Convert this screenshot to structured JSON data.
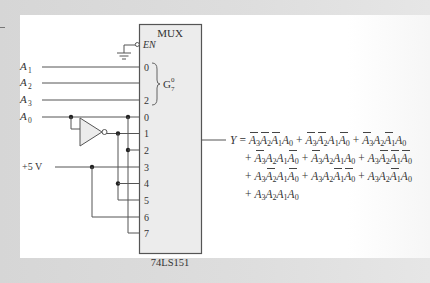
{
  "mux": {
    "title": "MUX",
    "enable_label": "EN",
    "part_number": "74LS151",
    "select_group": {
      "label": "G",
      "superscript": "0",
      "subscript": "7",
      "pins": [
        "0",
        "",
        "2"
      ]
    },
    "data_pins": [
      "0",
      "1",
      "2",
      "3",
      "4",
      "5",
      "6",
      "7"
    ]
  },
  "inputs": {
    "A1": {
      "name": "A",
      "sub": "1"
    },
    "A2": {
      "name": "A",
      "sub": "2"
    },
    "A3": {
      "name": "A",
      "sub": "3"
    },
    "A0": {
      "name": "A",
      "sub": "0"
    },
    "vcc": "+5 V"
  },
  "output": {
    "label": "Y",
    "equals": "=",
    "plus": "+",
    "terms": [
      [
        {
          "v": "A",
          "s": "3",
          "bar": true
        },
        {
          "v": "A",
          "s": "2",
          "bar": true
        },
        {
          "v": "A",
          "s": "1",
          "bar": true
        },
        {
          "v": "A",
          "s": "0",
          "bar": false
        }
      ],
      [
        {
          "v": "A",
          "s": "3",
          "bar": true
        },
        {
          "v": "A",
          "s": "2",
          "bar": true
        },
        {
          "v": "A",
          "s": "1",
          "bar": false
        },
        {
          "v": "A",
          "s": "0",
          "bar": true
        }
      ],
      [
        {
          "v": "A",
          "s": "3",
          "bar": true
        },
        {
          "v": "A",
          "s": "2",
          "bar": false
        },
        {
          "v": "A",
          "s": "1",
          "bar": true
        },
        {
          "v": "A",
          "s": "0",
          "bar": false
        }
      ],
      [
        {
          "v": "A",
          "s": "3",
          "bar": true
        },
        {
          "v": "A",
          "s": "2",
          "bar": false
        },
        {
          "v": "A",
          "s": "1",
          "bar": false
        },
        {
          "v": "A",
          "s": "0",
          "bar": true
        }
      ],
      [
        {
          "v": "A",
          "s": "3",
          "bar": true
        },
        {
          "v": "A",
          "s": "2",
          "bar": false
        },
        {
          "v": "A",
          "s": "1",
          "bar": false
        },
        {
          "v": "A",
          "s": "0",
          "bar": false
        }
      ],
      [
        {
          "v": "A",
          "s": "3",
          "bar": false
        },
        {
          "v": "A",
          "s": "2",
          "bar": true
        },
        {
          "v": "A",
          "s": "1",
          "bar": true
        },
        {
          "v": "A",
          "s": "0",
          "bar": true
        }
      ],
      [
        {
          "v": "A",
          "s": "3",
          "bar": false
        },
        {
          "v": "A",
          "s": "2",
          "bar": true
        },
        {
          "v": "A",
          "s": "1",
          "bar": false
        },
        {
          "v": "A",
          "s": "0",
          "bar": true
        }
      ],
      [
        {
          "v": "A",
          "s": "3",
          "bar": false
        },
        {
          "v": "A",
          "s": "2",
          "bar": false
        },
        {
          "v": "A",
          "s": "1",
          "bar": true
        },
        {
          "v": "A",
          "s": "0",
          "bar": true
        }
      ],
      [
        {
          "v": "A",
          "s": "3",
          "bar": false
        },
        {
          "v": "A",
          "s": "2",
          "bar": false
        },
        {
          "v": "A",
          "s": "1",
          "bar": true
        },
        {
          "v": "A",
          "s": "0",
          "bar": false
        }
      ],
      [
        {
          "v": "A",
          "s": "3",
          "bar": false
        },
        {
          "v": "A",
          "s": "2",
          "bar": false
        },
        {
          "v": "A",
          "s": "1",
          "bar": false
        },
        {
          "v": "A",
          "s": "0",
          "bar": false
        }
      ]
    ],
    "lines": [
      [
        0,
        1,
        2
      ],
      [
        3,
        4,
        5
      ],
      [
        6,
        7,
        8
      ],
      [
        9
      ]
    ]
  },
  "colors": {
    "wire": "#555555",
    "box_fill": "#ececec",
    "box_stroke": "#555555",
    "text": "#333333"
  }
}
